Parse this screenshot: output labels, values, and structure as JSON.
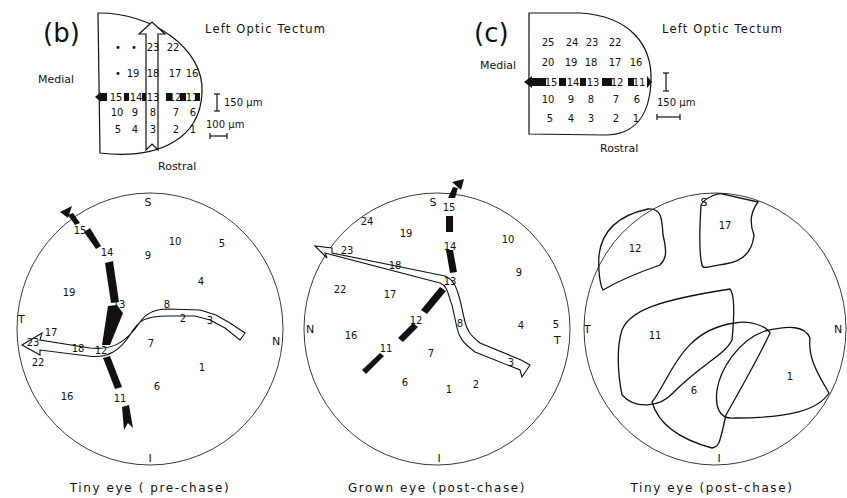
{
  "panel_b": {
    "label": "(b)",
    "title": "Left Optic Tectum",
    "medial_label": "Medial",
    "rostral_label": "Rostral",
    "scale_vertical": "150 μm",
    "scale_horizontal": "100 μm",
    "grid": [
      [
        "•",
        "•",
        "23",
        "22",
        ""
      ],
      [
        "•",
        "19",
        "18",
        "17",
        "16"
      ],
      [
        "15",
        "14",
        "13",
        "12",
        "11"
      ],
      [
        "10",
        "9",
        "8",
        "7",
        "6"
      ],
      [
        "5",
        "4",
        "3",
        "2",
        "1"
      ]
    ]
  },
  "panel_c": {
    "label": "(c)",
    "title": "Left Optic Tectum",
    "medial_label": "Medial",
    "rostral_label": "Rostral",
    "scale_label": "150 μm",
    "grid": [
      [
        "25",
        "24",
        "23",
        "22",
        ""
      ],
      [
        "20",
        "19",
        "18",
        "17",
        "16"
      ],
      [
        "15",
        "14",
        "13",
        "12",
        "11"
      ],
      [
        "10",
        "9",
        "8",
        "7",
        "6"
      ],
      [
        "5",
        "4",
        "3",
        "2",
        "1"
      ]
    ]
  },
  "field_1": {
    "caption": "Tiny eye ( pre-chase)",
    "S": "S",
    "I": "I",
    "T": "T",
    "N": "N",
    "points": [
      "15",
      "14",
      "10",
      "5",
      "9",
      "4",
      "19",
      "13",
      "8",
      "2",
      "3",
      "17",
      "23",
      "18",
      "12",
      "7",
      "22",
      "1",
      "6",
      "16",
      "11"
    ]
  },
  "field_2": {
    "caption": "Grown eye (post-chase)",
    "S": "S",
    "I": "I",
    "T": "T",
    "N": "N",
    "points": [
      "24",
      "15",
      "19",
      "10",
      "14",
      "23",
      "18",
      "13",
      "9",
      "22",
      "17",
      "12",
      "8",
      "4",
      "5",
      "16",
      "11",
      "7",
      "3",
      "6",
      "1",
      "2"
    ]
  },
  "field_3": {
    "caption": "Tiny eye (post-chase)",
    "S": "S",
    "I": "I",
    "T": "T",
    "N": "N",
    "fields": [
      "12",
      "17",
      "11",
      "6",
      "1"
    ]
  }
}
